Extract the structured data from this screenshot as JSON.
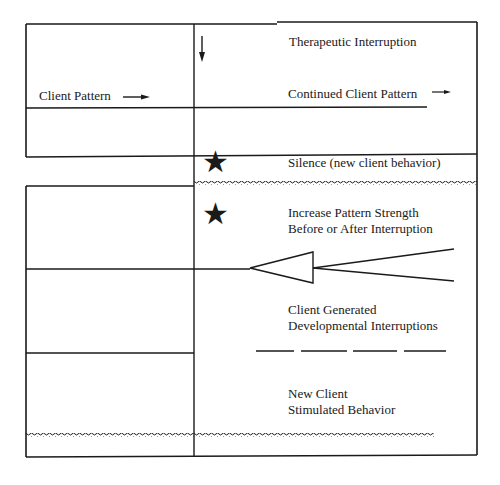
{
  "diagram": {
    "left_label": "Client Pattern",
    "labels": {
      "therapeutic_interruption": "Therapeutic Interruption",
      "continued_client_pattern": "Continued Client Pattern",
      "silence": "Silence (new client behavior)",
      "increase_line1": "Increase Pattern Strength",
      "increase_line2": "Before or After Interruption",
      "client_generated_line1": "Client Generated",
      "client_generated_line2": "Developmental Interruptions",
      "new_client_line1": "New Client",
      "new_client_line2": "Stimulated Behavior"
    },
    "icons": [
      "down-arrow",
      "right-arrow",
      "star",
      "star",
      "converging-arrowhead",
      "dashed-line",
      "wavy-line"
    ],
    "color": "#1a1a1a"
  }
}
